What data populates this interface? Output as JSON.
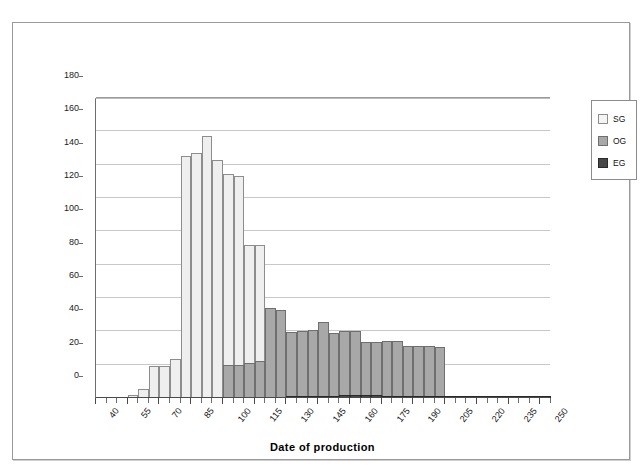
{
  "chart_data": {
    "type": "bar",
    "title": "",
    "xlabel": "Date of production",
    "ylabel": "Nos of vessels",
    "xlim": [
      40,
      255
    ],
    "ylim": [
      0,
      180
    ],
    "ytick_step": 20,
    "yticks": [
      0,
      20,
      40,
      60,
      80,
      100,
      120,
      140,
      160,
      180
    ],
    "xticks": [
      40,
      55,
      70,
      85,
      100,
      115,
      130,
      145,
      160,
      175,
      190,
      205,
      220,
      235,
      250
    ],
    "xtick_labels": [
      "40",
      "55",
      "70",
      "85",
      "100",
      "115",
      "130",
      "145",
      "160",
      "175",
      "190",
      "205",
      "220",
      "235",
      "250"
    ],
    "bin_width": 5,
    "bin_starts": [
      40,
      45,
      50,
      55,
      60,
      65,
      70,
      75,
      80,
      85,
      90,
      95,
      100,
      105,
      110,
      115,
      120,
      125,
      130,
      135,
      140,
      145,
      150,
      155,
      160,
      165,
      170,
      175,
      180,
      185,
      190,
      195,
      200,
      205,
      210,
      215,
      220,
      225,
      230,
      235,
      240,
      245,
      250
    ],
    "grid": true,
    "grid_axis": "y",
    "legend_position": "right",
    "series": [
      {
        "name": "SG",
        "color": "#efefef",
        "values": [
          0,
          0,
          0,
          2,
          5.5,
          19,
          19,
          23.5,
          145,
          147,
          157,
          143,
          134.5,
          133,
          92,
          92,
          0,
          0,
          0,
          0,
          0,
          0,
          0,
          0,
          0,
          0,
          0,
          0,
          0,
          0,
          0,
          0,
          0,
          0,
          0,
          0,
          0,
          0,
          0,
          0,
          0,
          0,
          0
        ]
      },
      {
        "name": "OG",
        "color": "#a8a8a8",
        "values": [
          0,
          0,
          0,
          0,
          0,
          0,
          0,
          0,
          0,
          0,
          0,
          0,
          20,
          20,
          21,
          22,
          54,
          53,
          39.5,
          40.5,
          41,
          45.5,
          39,
          40.5,
          40.5,
          33.5,
          33.5,
          34,
          34,
          31.5,
          31.5,
          31,
          30.5,
          0,
          0,
          0,
          0,
          0,
          0,
          0,
          0,
          0,
          0
        ]
      },
      {
        "name": "EG",
        "color": "#4a4a4a",
        "values": [
          0,
          0,
          0,
          0,
          0,
          0,
          0,
          0,
          0,
          0,
          0,
          0,
          0,
          0,
          0,
          0,
          0,
          0,
          0.5,
          1.2,
          1.5,
          1.5,
          1,
          1.8,
          1.8,
          1.8,
          1.8,
          1.5,
          1.5,
          1,
          1,
          1,
          1,
          1,
          1,
          1,
          1,
          1,
          1,
          1.5,
          0.8,
          0.8,
          0.5
        ]
      }
    ]
  },
  "legend": {
    "items": [
      {
        "label": "SG",
        "key": "sg"
      },
      {
        "label": "OG",
        "key": "og"
      },
      {
        "label": "EG",
        "key": "eg"
      }
    ]
  },
  "axes": {
    "x_title": "Date of production",
    "y_title": "Nos of vessels"
  }
}
